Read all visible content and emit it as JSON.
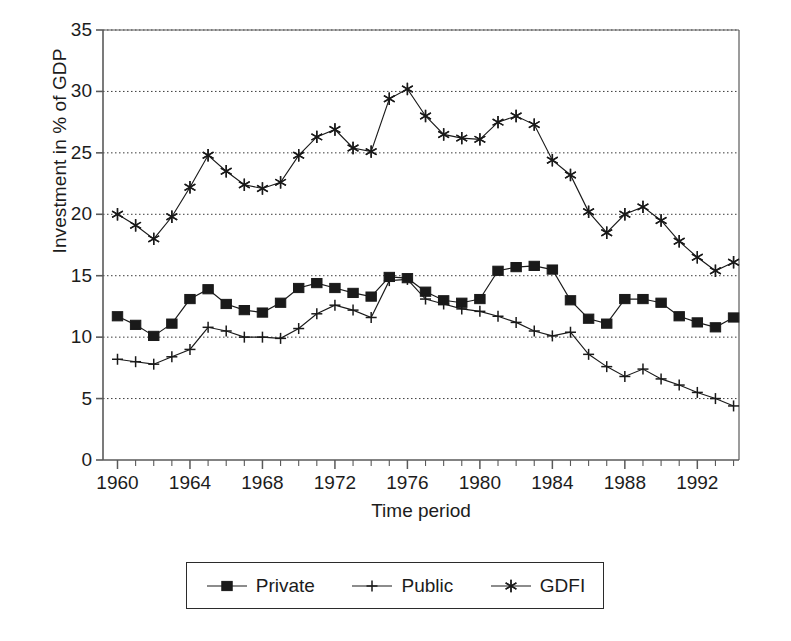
{
  "chart_data": {
    "type": "line",
    "title": "",
    "xlabel": "Time period",
    "ylabel": "Investment in % of GDP",
    "xlim": [
      1959.2,
      1994.3
    ],
    "ylim": [
      0,
      35
    ],
    "yticks": [
      0,
      5,
      10,
      15,
      20,
      25,
      30,
      35
    ],
    "ytick_labels": [
      "0",
      "5",
      "10",
      "15",
      "20",
      "25",
      "30",
      "35"
    ],
    "xticks": [
      1960,
      1964,
      1968,
      1972,
      1976,
      1980,
      1984,
      1988,
      1992
    ],
    "xtick_labels": [
      "1960",
      "1964",
      "1968",
      "1972",
      "1976",
      "1980",
      "1984",
      "1988",
      "1992"
    ],
    "minor_xtick_interval": 1,
    "grid": "horizontal-dotted",
    "legend_position": "below-center",
    "x": [
      1960,
      1961,
      1962,
      1963,
      1964,
      1965,
      1966,
      1967,
      1968,
      1969,
      1970,
      1971,
      1972,
      1973,
      1974,
      1975,
      1976,
      1977,
      1978,
      1979,
      1980,
      1981,
      1982,
      1983,
      1984,
      1985,
      1986,
      1987,
      1988,
      1989,
      1990,
      1991,
      1992,
      1993,
      1994
    ],
    "series": [
      {
        "name": "Private",
        "marker": "filled-square",
        "values": [
          11.7,
          11.0,
          10.1,
          11.1,
          13.1,
          13.9,
          12.7,
          12.2,
          12.0,
          12.8,
          14.0,
          14.4,
          14.0,
          13.6,
          13.3,
          14.9,
          14.8,
          13.7,
          13.0,
          12.8,
          13.1,
          15.4,
          15.7,
          15.8,
          15.5,
          13.0,
          11.5,
          11.1,
          13.1,
          13.1,
          12.8,
          11.7,
          11.2,
          10.8,
          11.6
        ]
      },
      {
        "name": "Public",
        "marker": "plus",
        "values": [
          8.2,
          8.0,
          7.8,
          8.4,
          9.0,
          10.8,
          10.5,
          10.0,
          10.0,
          9.9,
          10.7,
          11.9,
          12.6,
          12.2,
          11.6,
          14.6,
          14.7,
          13.1,
          12.7,
          12.3,
          12.1,
          11.7,
          11.2,
          10.5,
          10.1,
          10.4,
          8.6,
          7.6,
          6.8,
          7.4,
          6.6,
          6.1,
          5.5,
          5.0,
          4.4
        ]
      },
      {
        "name": "GDFI",
        "marker": "asterisk",
        "values": [
          20.0,
          19.1,
          18.0,
          19.8,
          22.2,
          24.8,
          23.5,
          22.4,
          22.1,
          22.6,
          24.8,
          26.3,
          26.9,
          25.4,
          25.1,
          29.4,
          30.2,
          28.0,
          26.5,
          26.2,
          26.1,
          27.5,
          28.0,
          27.3,
          24.4,
          23.2,
          20.2,
          18.5,
          20.0,
          20.6,
          19.5,
          17.8,
          16.5,
          15.4,
          16.1
        ]
      }
    ]
  },
  "legend": {
    "entries": [
      {
        "label": "Private",
        "marker": "filled-square"
      },
      {
        "label": "Public",
        "marker": "plus"
      },
      {
        "label": "GDFI",
        "marker": "asterisk"
      }
    ]
  },
  "colors": {
    "ink": "#1a1a1a",
    "axis": "#5a5a5a",
    "grid": "#3a3a3a",
    "background": "#ffffff"
  }
}
